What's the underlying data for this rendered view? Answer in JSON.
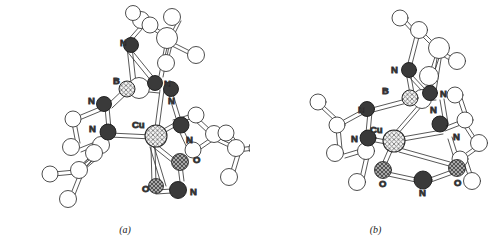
{
  "figure": {
    "type": "molecular-structure-diagram",
    "background_color": "#ffffff",
    "style": "ball-and-stick crystallographic ORTEP-like drawing",
    "panels": [
      {
        "id": "a",
        "caption": "(a)",
        "metal_label": "Cu",
        "boron_label": "B",
        "nitro_binding_mode": "eta1-N (nitro) / O,O asymmetric",
        "labels": [
          {
            "text": "N",
            "x": 124,
            "y": 43
          },
          {
            "text": "B",
            "x": 118,
            "y": 80
          },
          {
            "text": "N",
            "x": 162,
            "y": 84
          },
          {
            "text": "N",
            "x": 103,
            "y": 101
          },
          {
            "text": "N",
            "x": 168,
            "y": 101
          },
          {
            "text": "N",
            "x": 90,
            "y": 130
          },
          {
            "text": "N",
            "x": 188,
            "y": 139
          },
          {
            "text": "Cu",
            "x": 139,
            "y": 125
          },
          {
            "text": "O",
            "x": 196,
            "y": 160
          },
          {
            "text": "O",
            "x": 146,
            "y": 189
          },
          {
            "text": "N",
            "x": 194,
            "y": 191
          }
        ]
      },
      {
        "id": "b",
        "caption": "(b)",
        "metal_label": "Cu",
        "boron_label": "B",
        "nitro_binding_mode": "eta2-O,O chelating nitro",
        "labels": [
          {
            "text": "N",
            "x": 392,
            "y": 70
          },
          {
            "text": "B",
            "x": 383,
            "y": 91
          },
          {
            "text": "N",
            "x": 424,
            "y": 92
          },
          {
            "text": "N",
            "x": 362,
            "y": 110
          },
          {
            "text": "N",
            "x": 427,
            "y": 110
          },
          {
            "text": "N",
            "x": 354,
            "y": 139
          },
          {
            "text": "N",
            "x": 446,
            "y": 137
          },
          {
            "text": "Cu",
            "x": 398,
            "y": 136
          },
          {
            "text": "O",
            "x": 389,
            "y": 182
          },
          {
            "text": "N",
            "x": 427,
            "y": 186
          },
          {
            "text": "O",
            "x": 461,
            "y": 181
          }
        ]
      }
    ],
    "atom_legend": [
      {
        "element": "C",
        "fill": "#ffffff",
        "pattern": "open",
        "stroke": "#333333"
      },
      {
        "element": "H",
        "fill": "#ffffff",
        "pattern": "open",
        "stroke": "#333333"
      },
      {
        "element": "N",
        "fill": "#3a3a3a",
        "pattern": "solid-dark",
        "stroke": "#1a1a1a"
      },
      {
        "element": "O",
        "fill": "#9a9a9a",
        "pattern": "cross-hatch-gray",
        "stroke": "#2b2b2b"
      },
      {
        "element": "Cu",
        "fill": "#f0f0f0",
        "pattern": "cross-hatch-light",
        "stroke": "#2b2b2b"
      },
      {
        "element": "B",
        "fill": "#e8e8e8",
        "pattern": "cross-hatch-light",
        "stroke": "#2b2b2b"
      }
    ],
    "colors": {
      "bond_stroke": "#3a3a3a",
      "bond_fill": "#ffffff",
      "nitrogen": "#3a3a3a",
      "oxygen": "#9a9a9a",
      "carbon": "#ffffff",
      "label": "#0d0d0d"
    }
  }
}
